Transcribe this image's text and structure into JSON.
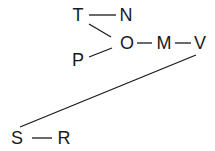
{
  "diagram": {
    "type": "graph",
    "nodes": [
      {
        "id": "T",
        "label": "T",
        "x": 78,
        "y": 15
      },
      {
        "id": "N",
        "label": "N",
        "x": 126,
        "y": 15
      },
      {
        "id": "O",
        "label": "O",
        "x": 127,
        "y": 43
      },
      {
        "id": "M",
        "label": "M",
        "x": 164,
        "y": 43
      },
      {
        "id": "V",
        "label": "V",
        "x": 200,
        "y": 43
      },
      {
        "id": "P",
        "label": "P",
        "x": 78,
        "y": 60
      },
      {
        "id": "S",
        "label": "S",
        "x": 17,
        "y": 138
      },
      {
        "id": "R",
        "label": "R",
        "x": 64,
        "y": 138
      }
    ],
    "edges": [
      {
        "from": "T",
        "to": "N",
        "x1": 89,
        "y1": 15,
        "x2": 116,
        "y2": 15
      },
      {
        "from": "T",
        "to": "O",
        "x1": 89,
        "y1": 24,
        "x2": 111,
        "y2": 37
      },
      {
        "from": "P",
        "to": "O",
        "x1": 89,
        "y1": 57,
        "x2": 112,
        "y2": 48
      },
      {
        "from": "O",
        "to": "M",
        "x1": 137,
        "y1": 43,
        "x2": 152,
        "y2": 43
      },
      {
        "from": "M",
        "to": "V",
        "x1": 175,
        "y1": 43,
        "x2": 191,
        "y2": 43
      },
      {
        "from": "V",
        "to": "S",
        "x1": 196,
        "y1": 55,
        "x2": 20,
        "y2": 127
      },
      {
        "from": "S",
        "to": "R",
        "x1": 32,
        "y1": 138,
        "x2": 52,
        "y2": 138
      }
    ],
    "line_color": "#1a1a1a",
    "background": "#ffffff"
  }
}
